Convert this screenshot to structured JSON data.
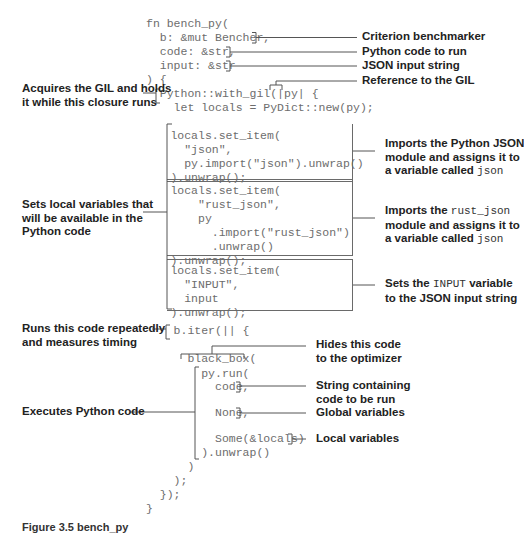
{
  "code": {
    "lines": [
      "fn bench_py(",
      "  b: &mut Bencher,",
      "  code: &str,",
      "  input: &str",
      ") {",
      "  Python::with_gil(|py| {",
      "    let locals = PyDict::new(py);",
      "      locals.set_item(",
      "        \"json\",",
      "        py.import(\"json\").unwrap()",
      "      ).unwrap();",
      "      locals.set_item(",
      "          \"rust_json\",",
      "          py",
      "            .import(\"rust_json\")",
      "            .unwrap()",
      "      ).unwrap();",
      "      locals.set_item(",
      "        \"INPUT\",",
      "        input",
      "      ).unwrap();",
      "    b.iter(|| {",
      "      black_box(",
      "        py.run(",
      "          code,",
      "          None,",
      "          Some(&locals)",
      "        ).unwrap()",
      "      )",
      "    );",
      "  });",
      "}"
    ]
  },
  "annotations": {
    "right": {
      "criterion": "Criterion benchmarker",
      "python_code": "Python code to run",
      "json_input": "JSON input string",
      "gil_ref": "Reference to the GIL",
      "import_json_1": "Imports the Python JSON",
      "import_json_2": "module and assigns it to",
      "import_json_3_pre": "a variable called ",
      "import_json_3_code": "json",
      "import_rust_1_pre": "Imports the ",
      "import_rust_1_code": "rust_json",
      "import_rust_2": "module and assigns it to",
      "import_rust_3_pre": "a variable called ",
      "import_rust_3_code": "json",
      "input_var_1_pre": "Sets the ",
      "input_var_1_code": "INPUT",
      "input_var_1_post": " variable",
      "input_var_2": "to the JSON input string",
      "black_box_1": "Hides this code",
      "black_box_2": "to the optimizer",
      "code_string_1": "String containing",
      "code_string_2": "code to be run",
      "globals": "Global variables",
      "locals": "Local variables"
    },
    "left": {
      "gil_1": "Acquires the GIL and holds",
      "gil_2": "it while this closure runs",
      "locals_1": "Sets local variables that",
      "locals_2": "will be available in the",
      "locals_3": "Python code",
      "iter_1": "Runs this code repeatedly",
      "iter_2": "and measures timing",
      "exec": "Executes Python code"
    }
  },
  "caption": "Figure 3.5  bench_py"
}
